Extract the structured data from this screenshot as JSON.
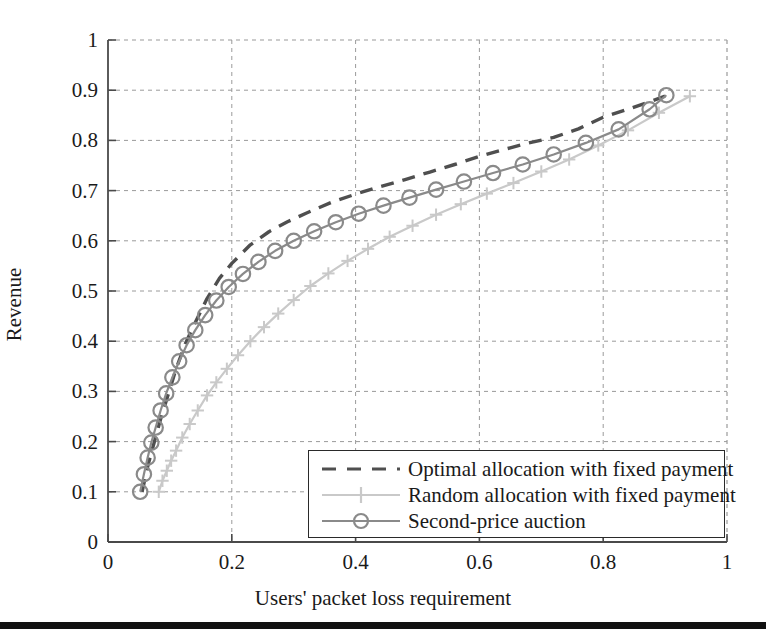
{
  "figure": {
    "background_color": "#ffffff",
    "axis_color": "#4a4a4a",
    "grid_color": "#9a9a9a"
  },
  "axes": {
    "x": {
      "label": "Users' packet loss requirement",
      "ticks": [
        "0",
        "0.2",
        "0.4",
        "0.6",
        "0.8",
        "1"
      ],
      "tick_values": [
        0,
        0.2,
        0.4,
        0.6,
        0.8,
        1
      ],
      "min": 0,
      "max": 1
    },
    "y": {
      "label": "Revenue",
      "ticks": [
        "0",
        "0.1",
        "0.2",
        "0.3",
        "0.4",
        "0.5",
        "0.6",
        "0.7",
        "0.8",
        "0.9",
        "1"
      ],
      "tick_values": [
        0,
        0.1,
        0.2,
        0.3,
        0.4,
        0.5,
        0.6,
        0.7,
        0.8,
        0.9,
        1
      ],
      "min": 0,
      "max": 1
    }
  },
  "legend": {
    "position": "lower-right inside plot",
    "entries": [
      {
        "label": "Optimal allocation with fixed payment",
        "color": "#4f4f4f",
        "style": "dashed",
        "marker": "none"
      },
      {
        "label": "Random allocation with fixed payment",
        "color": "#c9c9c9",
        "style": "solid",
        "marker": "plus"
      },
      {
        "label": "Second-price auction",
        "color": "#8a8a8a",
        "style": "solid",
        "marker": "circle"
      }
    ]
  },
  "chart_data": {
    "type": "line",
    "title": "",
    "xlabel": "Users' packet loss requirement",
    "ylabel": "Revenue",
    "xlim": [
      0,
      1
    ],
    "ylim": [
      0,
      1
    ],
    "grid": true,
    "legend_position": "lower right",
    "series": [
      {
        "name": "Optimal allocation with fixed payment",
        "color": "#4f4f4f",
        "style": "dashed",
        "marker": "none",
        "x": [
          0.055,
          0.065,
          0.075,
          0.085,
          0.095,
          0.11,
          0.125,
          0.14,
          0.16,
          0.18,
          0.2,
          0.23,
          0.26,
          0.29,
          0.32,
          0.36,
          0.4,
          0.44,
          0.48,
          0.52,
          0.56,
          0.6,
          0.64,
          0.68,
          0.72,
          0.76,
          0.8,
          0.84,
          0.87,
          0.9
        ],
        "y": [
          0.1,
          0.155,
          0.2,
          0.245,
          0.285,
          0.345,
          0.395,
          0.435,
          0.485,
          0.525,
          0.555,
          0.592,
          0.618,
          0.638,
          0.655,
          0.676,
          0.693,
          0.708,
          0.722,
          0.737,
          0.752,
          0.768,
          0.782,
          0.795,
          0.806,
          0.823,
          0.846,
          0.862,
          0.875,
          0.888
        ]
      },
      {
        "name": "Random allocation with fixed payment",
        "color": "#c9c9c9",
        "style": "solid",
        "marker": "plus",
        "x": [
          0.082,
          0.088,
          0.095,
          0.102,
          0.11,
          0.12,
          0.132,
          0.145,
          0.16,
          0.175,
          0.192,
          0.21,
          0.23,
          0.252,
          0.275,
          0.3,
          0.327,
          0.356,
          0.387,
          0.42,
          0.455,
          0.492,
          0.53,
          0.57,
          0.612,
          0.655,
          0.7,
          0.745,
          0.792,
          0.84,
          0.89,
          0.94
        ],
        "y": [
          0.1,
          0.122,
          0.142,
          0.162,
          0.182,
          0.208,
          0.235,
          0.262,
          0.292,
          0.318,
          0.345,
          0.372,
          0.4,
          0.428,
          0.455,
          0.482,
          0.51,
          0.535,
          0.56,
          0.584,
          0.608,
          0.63,
          0.652,
          0.673,
          0.694,
          0.715,
          0.738,
          0.762,
          0.79,
          0.82,
          0.855,
          0.888
        ]
      },
      {
        "name": "Second-price auction",
        "color": "#8a8a8a",
        "style": "solid",
        "marker": "circle",
        "x": [
          0.052,
          0.058,
          0.064,
          0.07,
          0.077,
          0.085,
          0.094,
          0.104,
          0.115,
          0.127,
          0.141,
          0.157,
          0.175,
          0.195,
          0.218,
          0.243,
          0.27,
          0.3,
          0.333,
          0.368,
          0.405,
          0.445,
          0.487,
          0.53,
          0.575,
          0.622,
          0.67,
          0.72,
          0.772,
          0.825,
          0.875,
          0.902
        ],
        "y": [
          0.1,
          0.135,
          0.168,
          0.198,
          0.228,
          0.262,
          0.296,
          0.328,
          0.36,
          0.392,
          0.422,
          0.452,
          0.481,
          0.508,
          0.534,
          0.558,
          0.58,
          0.6,
          0.619,
          0.637,
          0.654,
          0.67,
          0.686,
          0.702,
          0.718,
          0.735,
          0.752,
          0.772,
          0.795,
          0.822,
          0.862,
          0.89
        ]
      }
    ]
  }
}
